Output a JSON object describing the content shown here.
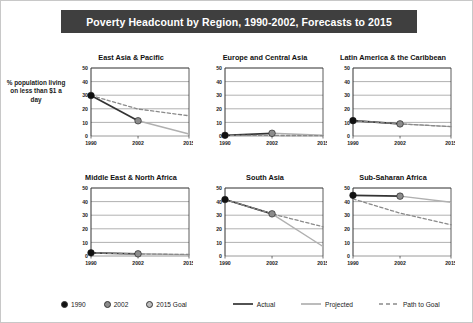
{
  "title": "Poverty Headcount by Region, 1990-2002, Forecasts to 2015",
  "ylabel": "% population living on less than $1 a day",
  "legend": {
    "items": [
      {
        "name": "1990",
        "marker": "dot",
        "color": "#111111"
      },
      {
        "name": "2002",
        "marker": "dot",
        "color": "#8c8c8c"
      },
      {
        "name": "2015 Goal",
        "marker": "dot",
        "color": "#bdbdbd"
      },
      {
        "name": "Actual",
        "marker": "solid-line",
        "color": "#333333"
      },
      {
        "name": "Projected",
        "marker": "solid-line",
        "color": "#b0b0b0"
      },
      {
        "name": "Path to Goal",
        "marker": "dashed-line",
        "color": "#8a8a8a"
      }
    ]
  },
  "colors": {
    "title_bar": "#3f3f3f",
    "title_text": "#ffffff",
    "actual": "#333333",
    "projected": "#b0b0b0",
    "path_to_goal": "#8a8a8a",
    "marker_1990": "#111111",
    "marker_2002": "#8c8c8c",
    "grid": "#8f8f8f",
    "axis": "#333333",
    "page_border": "#c8c8c8"
  },
  "chart_data": {
    "type": "line",
    "title": "Poverty Headcount by Region, 1990-2002, Forecasts to 2015",
    "xlabel": "",
    "ylabel": "% population living on less than $1 a day",
    "x": [
      1990,
      2002,
      2015
    ],
    "xticks": [
      "1990",
      "2002",
      "2015"
    ],
    "yticks": [
      0,
      10,
      20,
      30,
      40,
      50
    ],
    "ylim": [
      0,
      50
    ],
    "xlim": [
      1990,
      2015
    ],
    "grid": "horizontal",
    "legend_position": "bottom",
    "panels": [
      {
        "title": "East Asia & Pacific",
        "series": [
          {
            "name": "Actual",
            "style": "solid-dark",
            "x": [
              1990,
              2002
            ],
            "values": [
              29.8,
              11.2
            ]
          },
          {
            "name": "Projected",
            "style": "solid-light",
            "x": [
              2002,
              2015
            ],
            "values": [
              11.2,
              1.5
            ]
          },
          {
            "name": "Path to Goal",
            "style": "dashed",
            "x": [
              1990,
              2002,
              2015
            ],
            "values": [
              29.8,
              19.8,
              14.9
            ]
          }
        ],
        "points": [
          {
            "label": "1990",
            "x": 1990,
            "y": 29.8
          },
          {
            "label": "2002",
            "x": 2002,
            "y": 11.2
          }
        ]
      },
      {
        "title": "Europe and Central Asia",
        "series": [
          {
            "name": "Actual",
            "style": "solid-dark",
            "x": [
              1990,
              2002
            ],
            "values": [
              0.5,
              2.0
            ]
          },
          {
            "name": "Projected",
            "style": "solid-light",
            "x": [
              2002,
              2015
            ],
            "values": [
              2.0,
              0.6
            ]
          },
          {
            "name": "Path to Goal",
            "style": "dashed",
            "x": [
              1990,
              2002,
              2015
            ],
            "values": [
              0.5,
              0.4,
              0.3
            ]
          }
        ],
        "points": [
          {
            "label": "1990",
            "x": 1990,
            "y": 0.5
          },
          {
            "label": "2002",
            "x": 2002,
            "y": 2.0
          }
        ]
      },
      {
        "title": "Latin America & the Caribbean",
        "series": [
          {
            "name": "Actual",
            "style": "solid-dark",
            "x": [
              1990,
              2002
            ],
            "values": [
              11.3,
              8.9
            ]
          },
          {
            "name": "Projected",
            "style": "solid-light",
            "x": [
              2002,
              2015
            ],
            "values": [
              8.9,
              6.9
            ]
          },
          {
            "name": "Path to Goal",
            "style": "dashed",
            "x": [
              1990,
              2002,
              2015
            ],
            "values": [
              11.3,
              8.9,
              6.9
            ]
          }
        ],
        "points": [
          {
            "label": "1990",
            "x": 1990,
            "y": 11.3
          },
          {
            "label": "2002",
            "x": 2002,
            "y": 8.9
          }
        ]
      },
      {
        "title": "Middle East & North Africa",
        "series": [
          {
            "name": "Actual",
            "style": "solid-dark",
            "x": [
              1990,
              2002
            ],
            "values": [
              2.3,
              1.6
            ]
          },
          {
            "name": "Projected",
            "style": "solid-light",
            "x": [
              2002,
              2015
            ],
            "values": [
              1.6,
              0.9
            ]
          },
          {
            "name": "Path to Goal",
            "style": "dashed",
            "x": [
              1990,
              2002,
              2015
            ],
            "values": [
              2.3,
              1.5,
              1.1
            ]
          }
        ],
        "points": [
          {
            "label": "1990",
            "x": 1990,
            "y": 2.3
          },
          {
            "label": "2002",
            "x": 2002,
            "y": 1.6
          }
        ]
      },
      {
        "title": "South Asia",
        "series": [
          {
            "name": "Actual",
            "style": "solid-dark",
            "x": [
              1990,
              2002
            ],
            "values": [
              41.5,
              31.0
            ]
          },
          {
            "name": "Projected",
            "style": "solid-light",
            "x": [
              2002,
              2015
            ],
            "values": [
              31.0,
              7.0
            ]
          },
          {
            "name": "Path to Goal",
            "style": "dashed",
            "x": [
              1990,
              2002,
              2015
            ],
            "values": [
              41.5,
              31.0,
              21.5
            ]
          }
        ],
        "points": [
          {
            "label": "1990",
            "x": 1990,
            "y": 41.5
          },
          {
            "label": "2002",
            "x": 2002,
            "y": 31.0
          }
        ]
      },
      {
        "title": "Sub-Saharan Africa",
        "series": [
          {
            "name": "Actual",
            "style": "solid-dark",
            "x": [
              1990,
              2002
            ],
            "values": [
              44.6,
              44.0
            ]
          },
          {
            "name": "Projected",
            "style": "solid-light",
            "x": [
              2002,
              2015
            ],
            "values": [
              44.0,
              39.5
            ]
          },
          {
            "name": "Path to Goal",
            "style": "dashed",
            "x": [
              1990,
              2002,
              2015
            ],
            "values": [
              42.0,
              31.5,
              23.0
            ]
          }
        ],
        "points": [
          {
            "label": "1990",
            "x": 1990,
            "y": 44.6
          },
          {
            "label": "2002",
            "x": 2002,
            "y": 44.0
          }
        ]
      }
    ]
  },
  "layout": {
    "panel_positions": [
      {
        "left": 68,
        "top": 52
      },
      {
        "left": 202,
        "top": 52
      },
      {
        "left": 330,
        "top": 52
      },
      {
        "left": 68,
        "top": 172
      },
      {
        "left": 202,
        "top": 172
      },
      {
        "left": 330,
        "top": 172
      }
    ],
    "panel_width": 124,
    "plot_width": 124,
    "plot_height": 84
  }
}
